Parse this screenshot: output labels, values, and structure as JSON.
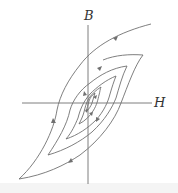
{
  "diagram": {
    "axes": {
      "vertical_label": "B",
      "horizontal_label": "H"
    },
    "colors": {
      "line": "#707070",
      "background": "#ffffff"
    },
    "loops": [
      {
        "name": "outer",
        "count_arrows": 3
      },
      {
        "name": "middle",
        "count_arrows": 2
      },
      {
        "name": "inner",
        "count_arrows": 2
      },
      {
        "name": "innermost",
        "count_arrows": 2
      }
    ],
    "initial_curve": "virgin magnetization curve from origin to upper right"
  }
}
